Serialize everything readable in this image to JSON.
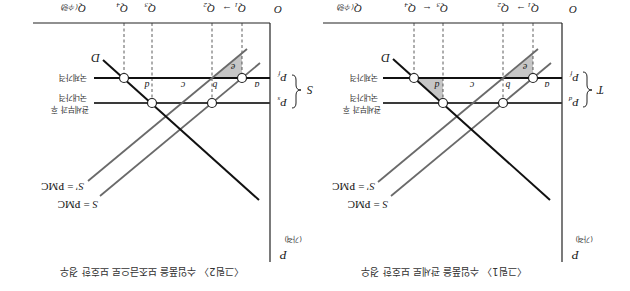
{
  "figures": [
    {
      "caption": "〈그림1〉 수입품을 관세로 보호한 경우",
      "origin": "O",
      "y_axis": {
        "symbol": "P",
        "unit": "(가격)"
      },
      "x_axis": {
        "symbol": "Q",
        "unit": "(수량)"
      },
      "quantities": [
        {
          "symbol": "Q",
          "sub": "1"
        },
        {
          "symbol": "Q",
          "sub": "2"
        },
        {
          "symbol": "Q",
          "sub": "3"
        },
        {
          "symbol": "Q",
          "sub": "4"
        }
      ],
      "arrows": {
        "q1_to_q2": "→",
        "q4_to_q3": "←"
      },
      "price_lower": {
        "symbol": "P",
        "sub": "f",
        "label": "국제가격"
      },
      "price_upper": {
        "symbol": "P",
        "sub": "d",
        "label_line1": "관세부과 후",
        "label_line2": "국내가격"
      },
      "gap_label": "T",
      "demand_label": "D",
      "supply": {
        "symbol": "S",
        "rest": " = PMC"
      },
      "supply_shifted": {
        "symbol": "S'",
        "rest": " = PMC"
      },
      "areas": {
        "a": "a",
        "b": "b",
        "c": "c",
        "d": "d",
        "e": "e"
      },
      "shaded_areas": [
        "d",
        "e"
      ]
    },
    {
      "caption": "〈그림2〉 수입품을 보조금으로 보호한 경우",
      "origin": "O",
      "y_axis": {
        "symbol": "P",
        "unit": "(가격)"
      },
      "x_axis": {
        "symbol": "Q",
        "unit": "(수량)"
      },
      "quantities": [
        {
          "symbol": "Q",
          "sub": "1"
        },
        {
          "symbol": "Q",
          "sub": "2"
        },
        {
          "symbol": "Q",
          "sub": "3"
        },
        {
          "symbol": "Q",
          "sub": "4"
        }
      ],
      "arrows": {
        "q1_to_q2": "→"
      },
      "price_lower": {
        "symbol": "P",
        "sub": "f",
        "label": "국제가격"
      },
      "price_upper": {
        "symbol": "P",
        "sub": "s",
        "label_line1": "관세부과 후",
        "label_line2": "국내가격"
      },
      "gap_label": "S",
      "demand_label": "D",
      "supply": {
        "symbol": "S",
        "rest": " = PMC"
      },
      "supply_shifted": {
        "symbol": "S'",
        "rest": " = PMC"
      },
      "areas": {
        "a": "a",
        "b": "b",
        "c": "c",
        "d": "d",
        "e": "e"
      },
      "shaded_areas": [
        "e"
      ]
    }
  ],
  "colors": {
    "background": "#ffffff",
    "axis": "#222222",
    "world_price_line": "#111111",
    "domestic_price_line": "#3a3a3a",
    "demand": "#111111",
    "supply": "#6a6a6a",
    "shade": "#c6c6c6",
    "point_fill": "#ffffff"
  }
}
